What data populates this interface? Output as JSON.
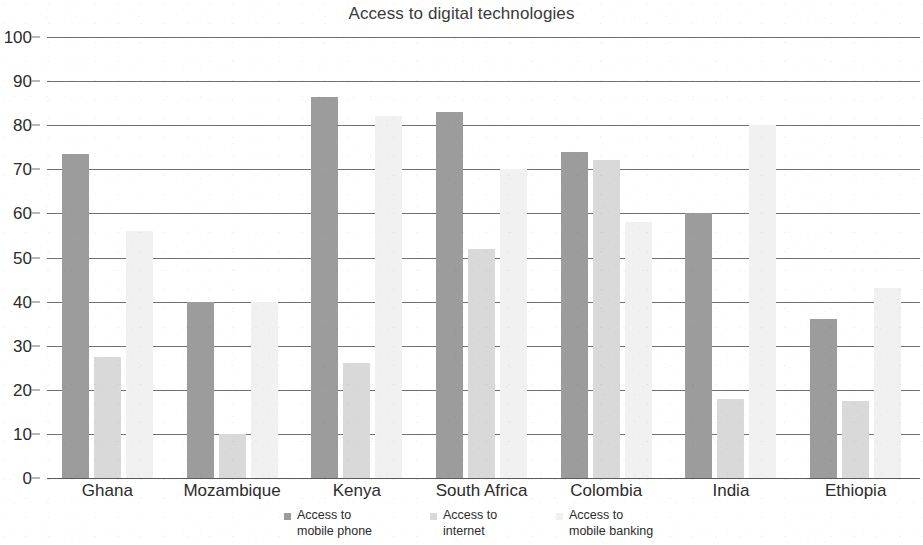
{
  "chart_data": {
    "type": "bar",
    "title": "Access to digital technologies",
    "xlabel": "",
    "ylabel": "",
    "ylim": [
      0,
      100
    ],
    "ytick_step": 10,
    "yticks": [
      0,
      10,
      20,
      30,
      40,
      50,
      60,
      70,
      80,
      90,
      100
    ],
    "grid": true,
    "legend_position": "bottom",
    "categories": [
      "Ghana",
      "Mozambique",
      "Kenya",
      "South Africa",
      "Colombia",
      "India",
      "Ethiopia"
    ],
    "series": [
      {
        "name": "Access to\nmobile phone",
        "legend_label": "Access to\nmobile phone",
        "color": "#9c9c9c",
        "values": [
          73.5,
          40,
          86.5,
          83,
          74,
          60,
          36
        ]
      },
      {
        "name": "Access to\ninternet",
        "legend_label": "Access to\ninternet",
        "color": "#d9d9d9",
        "values": [
          27.5,
          10,
          26,
          52,
          72,
          18,
          17.5
        ]
      },
      {
        "name": "Access to\nmobile banking",
        "legend_label": "Access to\nmobile banking",
        "color": "#f1f1f1",
        "values": [
          56,
          40,
          82,
          70,
          58,
          80,
          43
        ]
      }
    ]
  },
  "axis": {
    "y_tick_labels": [
      "100",
      "90",
      "80",
      "70",
      "60",
      "50",
      "40",
      "30",
      "20",
      "10",
      "0"
    ]
  },
  "legend": {
    "items": [
      {
        "label": "Access to\nmobile phone",
        "color": "#9c9c9c"
      },
      {
        "label": "Access to\ninternet",
        "color": "#d9d9d9"
      },
      {
        "label": "Access to\nmobile banking",
        "color": "#f1f1f1"
      }
    ]
  }
}
